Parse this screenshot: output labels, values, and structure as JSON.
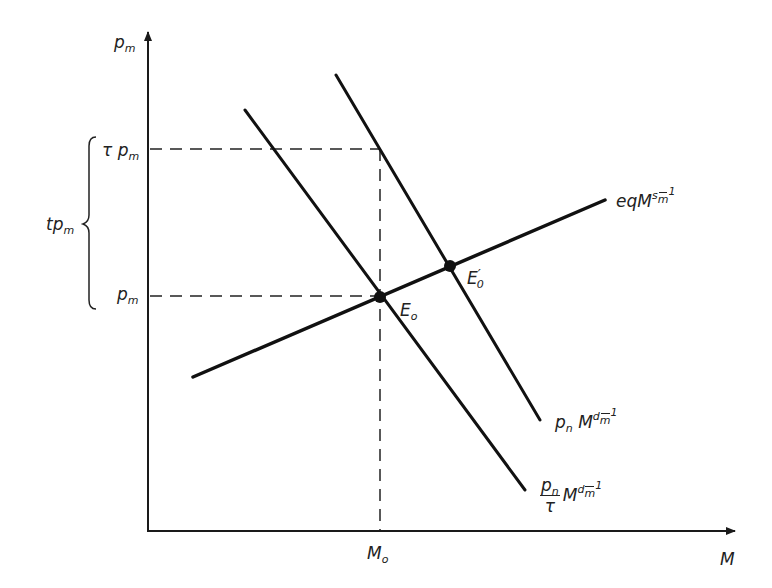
{
  "diagram": {
    "type": "supply-demand",
    "axes": {
      "y_label": "p",
      "y_label_sub": "m",
      "x_label": "M"
    },
    "y_ticks": [
      {
        "id": "tau_pm",
        "prefix": "τ ",
        "main": "p",
        "sub": "m"
      },
      {
        "id": "pm",
        "prefix": "",
        "main": "p",
        "sub": "m"
      }
    ],
    "x_ticks": [
      {
        "id": "Mo",
        "main": "M",
        "sub": "o"
      }
    ],
    "brace_label": {
      "main": "tp",
      "sub": "m"
    },
    "curves": [
      {
        "id": "supply",
        "label_main": "eqM",
        "label_sup1": "s",
        "label_sup2": "m",
        "label_sup3": "1",
        "slope": "upward"
      },
      {
        "id": "demand_pn",
        "label_pre_main": "p",
        "label_pre_sub": "n",
        "label_main": "M",
        "label_sup1": "d",
        "label_sup2": "m",
        "label_sup3": "1",
        "slope": "downward"
      },
      {
        "id": "demand_pn_tau",
        "label_num": "p",
        "label_num_sub": "n",
        "label_den": "τ",
        "label_main": "M",
        "label_sup1": "d",
        "label_sup2": "m",
        "label_sup3": "1",
        "slope": "downward"
      }
    ],
    "points": [
      {
        "id": "E0",
        "main": "E",
        "sub": "o"
      },
      {
        "id": "E0prime",
        "main": "E",
        "prime": "′",
        "sub": "0"
      }
    ]
  }
}
